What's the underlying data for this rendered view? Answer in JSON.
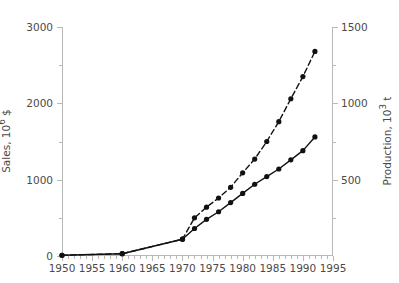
{
  "chart_data": {
    "type": "line",
    "title": "",
    "xlabel": "",
    "ylabel": "Sales, 10^6 $",
    "y2label": "Production, 10^3 t",
    "grid": false,
    "legend": "none",
    "xlim": [
      1950,
      1995
    ],
    "ylim": [
      0,
      3000
    ],
    "y2lim": [
      0,
      1500
    ],
    "xticks": [
      1950,
      1955,
      1960,
      1965,
      1970,
      1975,
      1980,
      1985,
      1990,
      1995
    ],
    "xtick_labels": [
      "1950",
      "1955",
      "1960",
      "1965",
      "1970",
      "1975",
      "1980",
      "1985",
      "1990",
      "1995"
    ],
    "yticks": [
      0,
      1000,
      2000,
      3000
    ],
    "ytick_labels": [
      "0",
      "1000",
      "2000",
      "3000"
    ],
    "yticks_minor": [
      500,
      1500,
      2500
    ],
    "y2ticks": [
      500,
      1000,
      1500
    ],
    "y2tick_labels": [
      "500",
      "1000",
      "1500"
    ],
    "y2ticks_minor": [
      250,
      750,
      1250
    ],
    "series": [
      {
        "name": "Sales",
        "axis": "left",
        "style": "dashed",
        "marker": "filled-circle",
        "x": [
          1950,
          1960,
          1970,
          1972,
          1974,
          1976,
          1978,
          1980,
          1982,
          1984,
          1986,
          1988,
          1990,
          1992
        ],
        "values": [
          10,
          30,
          220,
          500,
          640,
          760,
          900,
          1090,
          1270,
          1500,
          1760,
          2060,
          2350,
          2680
        ]
      },
      {
        "name": "Production",
        "axis": "right",
        "style": "solid",
        "marker": "filled-circle",
        "x": [
          1950,
          1960,
          1970,
          1972,
          1974,
          1976,
          1978,
          1980,
          1982,
          1984,
          1986,
          1988,
          1990,
          1992
        ],
        "values": [
          5,
          15,
          110,
          180,
          240,
          290,
          350,
          410,
          470,
          520,
          570,
          630,
          690,
          780
        ]
      }
    ]
  },
  "axes": {
    "y_left_title": "Sales, 10",
    "y_left_exp": "6",
    "y_left_unit": " $",
    "y_right_title": "Production, 10",
    "y_right_exp": "3",
    "y_right_unit": " t"
  }
}
